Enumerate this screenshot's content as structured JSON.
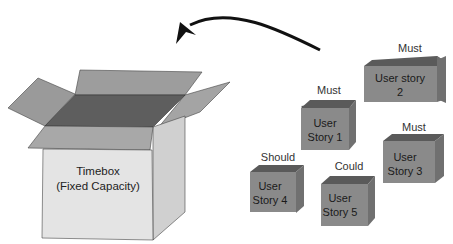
{
  "timebox": {
    "title": "Timebox",
    "subtitle": "(Fixed Capacity)"
  },
  "arrow": {
    "direction": "from user stories into timebox"
  },
  "stories": [
    {
      "priority": "Must",
      "line1": "User",
      "line2": "Story 1"
    },
    {
      "priority": "Must",
      "line1": "User story",
      "line2": "2"
    },
    {
      "priority": "Must",
      "line1": "User",
      "line2": "Story 3"
    },
    {
      "priority": "Should",
      "line1": "User",
      "line2": "Story 4"
    },
    {
      "priority": "Could",
      "line1": "User",
      "line2": "Story 5"
    }
  ],
  "colors": {
    "box_front": "#e2e2e2",
    "box_side": "#d0d0d0",
    "flap": "#9a9a9a",
    "box_inside": "#5e5e5e",
    "cube_front": "#8a8a8a",
    "cube_top": "#5c5c5c",
    "cube_side": "#6e6e6e",
    "arrow": "#111111"
  }
}
